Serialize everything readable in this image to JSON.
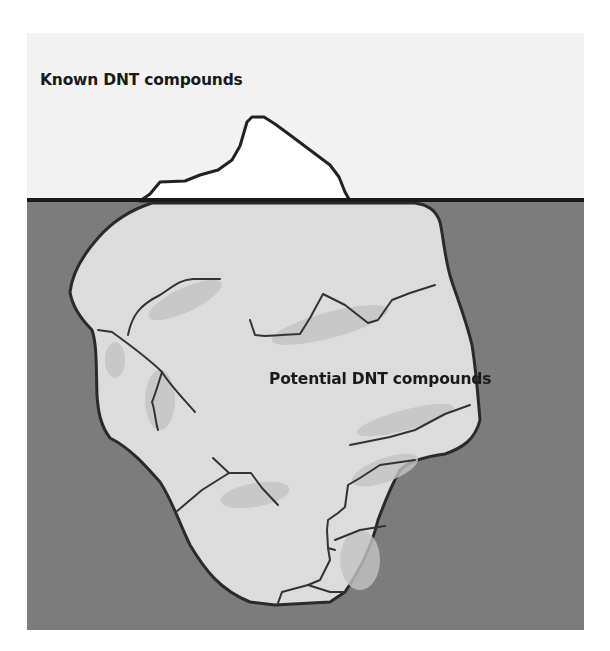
{
  "diagram": {
    "type": "iceberg-metaphor",
    "labels": {
      "above_water": "Known DNT compounds",
      "below_water": "Potential DNT compounds"
    },
    "colors": {
      "sky": "#f2f2f2",
      "water": "#7c7c7c",
      "waterline": "#1a1a1a",
      "iceberg_tip": "#ffffff",
      "iceberg_body": "#dcdcdc",
      "iceberg_shade": "#c4c4c4",
      "outline": "#2a2a2a"
    }
  }
}
